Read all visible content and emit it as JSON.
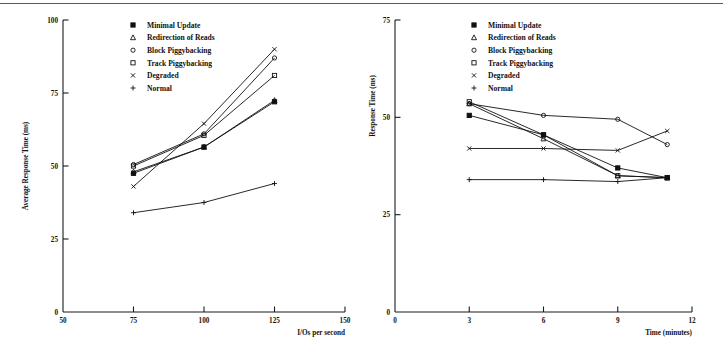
{
  "page": {
    "background": "#ffffff",
    "rule_color": "#5a5a5a",
    "ink_color": "#111111"
  },
  "legend_markers": [
    "minimal-update-marker",
    "redirection-of-reads-marker",
    "block-piggybacking-marker",
    "track-piggybacking-marker",
    "degraded-marker",
    "normal-marker"
  ],
  "chart_data": [
    {
      "id": "left",
      "type": "line",
      "title": "",
      "xlabel": "I/Os per second",
      "ylabel": "Average Response Time (ms)",
      "xlim": [
        50,
        150
      ],
      "ylim": [
        0,
        100
      ],
      "xticks": [
        50,
        75,
        100,
        125,
        150
      ],
      "yticks": [
        0,
        25,
        50,
        75,
        100
      ],
      "xtick_labels": [
        "50",
        "75",
        "100",
        "125",
        "150"
      ],
      "ytick_labels": [
        "0",
        "25",
        "50",
        "75",
        "100"
      ],
      "grid": false,
      "legend_position": "upper-center",
      "x": [
        75,
        100,
        125
      ],
      "series": [
        {
          "name": "Minimal Update",
          "marker": "square-filled",
          "values": [
            47.5,
            56.5,
            72.0
          ]
        },
        {
          "name": "Redirection of Reads",
          "marker": "triangle",
          "values": [
            48.0,
            56.5,
            72.5
          ]
        },
        {
          "name": "Block Piggybacking",
          "marker": "circle",
          "values": [
            50.5,
            61.0,
            87.0
          ]
        },
        {
          "name": "Track Piggybacking",
          "marker": "square",
          "values": [
            50.0,
            60.5,
            81.0
          ]
        },
        {
          "name": "Degraded",
          "marker": "cross-x",
          "values": [
            43.0,
            64.5,
            90.0
          ]
        },
        {
          "name": "Normal",
          "marker": "plus",
          "values": [
            34.0,
            37.5,
            44.0
          ]
        }
      ]
    },
    {
      "id": "right",
      "type": "line",
      "title": "",
      "xlabel": "Time (minutes)",
      "ylabel": "Response Time (ms)",
      "xlim": [
        0,
        12
      ],
      "ylim": [
        0,
        75
      ],
      "xticks": [
        0,
        3,
        6,
        9,
        12
      ],
      "yticks": [
        0,
        25,
        50,
        75
      ],
      "xtick_labels": [
        "0",
        "3",
        "6",
        "9",
        "12"
      ],
      "ytick_labels": [
        "0",
        "25",
        "50",
        "75"
      ],
      "grid": false,
      "legend_position": "upper-center",
      "x": [
        3,
        6,
        9,
        11
      ],
      "series": [
        {
          "name": "Minimal Update",
          "marker": "square-filled",
          "values": [
            50.5,
            45.5,
            37.0,
            34.5
          ]
        },
        {
          "name": "Redirection of Reads",
          "marker": "triangle",
          "values": [
            53.5,
            44.5,
            35.0,
            34.5
          ]
        },
        {
          "name": "Block Piggybacking",
          "marker": "circle",
          "values": [
            53.5,
            50.5,
            49.5,
            43.0
          ]
        },
        {
          "name": "Track Piggybacking",
          "marker": "square",
          "values": [
            54.0,
            45.5,
            35.0,
            34.5
          ]
        },
        {
          "name": "Degraded",
          "marker": "cross-x",
          "values": [
            42.0,
            42.0,
            41.5,
            46.5
          ]
        },
        {
          "name": "Normal",
          "marker": "plus",
          "values": [
            34.0,
            34.0,
            33.5,
            34.5
          ]
        }
      ]
    }
  ]
}
